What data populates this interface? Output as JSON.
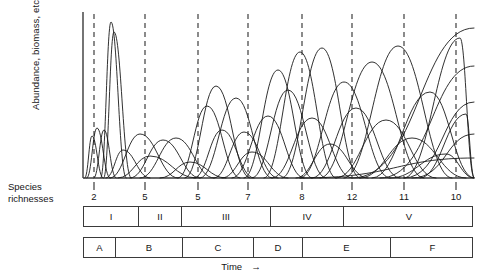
{
  "figure": {
    "y_axis_label": "Abundance, biomass, etc.",
    "x_axis_label": "Time",
    "x_axis_arrow": "→",
    "richness_label_line1": "Species",
    "richness_label_line2": "richnesses"
  },
  "chart_data": {
    "type": "line",
    "title": "",
    "xlabel": "Time",
    "ylabel": "Abundance, biomass, etc.",
    "grid": false,
    "legend": "none",
    "axis_color": "#3a3a3a",
    "curve_color": "#1a1a1a",
    "marker_line_color": "#4d4d4d",
    "marker_line_style": "dashed",
    "xlim": [
      0,
      390
    ],
    "ylim": [
      0,
      166
    ],
    "species_richness_ticks": [
      {
        "label": "2",
        "x": 94
      },
      {
        "label": "5",
        "x": 145
      },
      {
        "label": "5",
        "x": 198
      },
      {
        "label": "7",
        "x": 248
      },
      {
        "label": "8",
        "x": 302
      },
      {
        "label": "12",
        "x": 352
      },
      {
        "label": "11",
        "x": 404
      },
      {
        "label": "10",
        "x": 456
      }
    ],
    "dashed_marker_x": [
      94,
      145,
      198,
      248,
      302,
      352,
      404,
      456
    ],
    "stage_bands_roman": [
      {
        "label": "I",
        "start": 83,
        "end": 138
      },
      {
        "label": "II",
        "start": 138,
        "end": 181
      },
      {
        "label": "III",
        "start": 181,
        "end": 270
      },
      {
        "label": "IV",
        "start": 270,
        "end": 343
      },
      {
        "label": "V",
        "start": 343,
        "end": 473
      }
    ],
    "stage_bands_letter": [
      {
        "label": "A",
        "start": 83,
        "end": 115
      },
      {
        "label": "B",
        "start": 115,
        "end": 182
      },
      {
        "label": "C",
        "start": 182,
        "end": 253
      },
      {
        "label": "D",
        "start": 253,
        "end": 302
      },
      {
        "label": "E",
        "start": 302,
        "end": 390
      },
      {
        "label": "F",
        "start": 390,
        "end": 473
      }
    ],
    "series": [
      {
        "name": "sp-01",
        "peak_x": 92,
        "peak_y": 42,
        "left_x": 85,
        "right_x": 103
      },
      {
        "name": "sp-02",
        "peak_x": 97,
        "peak_y": 50,
        "left_x": 87,
        "right_x": 110
      },
      {
        "name": "sp-03",
        "peak_x": 104,
        "peak_y": 48,
        "left_x": 94,
        "right_x": 116
      },
      {
        "name": "sp-04",
        "peak_x": 111,
        "peak_y": 156,
        "left_x": 101,
        "right_x": 126
      },
      {
        "name": "sp-05",
        "peak_x": 114,
        "peak_y": 146,
        "left_x": 104,
        "right_x": 131
      },
      {
        "name": "sp-06",
        "peak_x": 123,
        "peak_y": 28,
        "left_x": 106,
        "right_x": 150
      },
      {
        "name": "sp-07",
        "peak_x": 140,
        "peak_y": 44,
        "left_x": 110,
        "right_x": 178
      },
      {
        "name": "sp-08",
        "peak_x": 150,
        "peak_y": 22,
        "left_x": 118,
        "right_x": 196
      },
      {
        "name": "sp-09",
        "peak_x": 163,
        "peak_y": 38,
        "left_x": 130,
        "right_x": 200
      },
      {
        "name": "sp-10",
        "peak_x": 176,
        "peak_y": 40,
        "left_x": 140,
        "right_x": 214
      },
      {
        "name": "sp-11",
        "peak_x": 190,
        "peak_y": 16,
        "left_x": 160,
        "right_x": 226
      },
      {
        "name": "sp-12",
        "peak_x": 207,
        "peak_y": 72,
        "left_x": 178,
        "right_x": 240
      },
      {
        "name": "sp-13",
        "peak_x": 216,
        "peak_y": 92,
        "left_x": 185,
        "right_x": 250
      },
      {
        "name": "sp-14",
        "peak_x": 222,
        "peak_y": 48,
        "left_x": 194,
        "right_x": 254
      },
      {
        "name": "sp-15",
        "peak_x": 236,
        "peak_y": 80,
        "left_x": 200,
        "right_x": 272
      },
      {
        "name": "sp-16",
        "peak_x": 244,
        "peak_y": 46,
        "left_x": 214,
        "right_x": 278
      },
      {
        "name": "sp-17",
        "peak_x": 252,
        "peak_y": 26,
        "left_x": 222,
        "right_x": 288
      },
      {
        "name": "sp-18",
        "peak_x": 268,
        "peak_y": 62,
        "left_x": 232,
        "right_x": 304
      },
      {
        "name": "sp-19",
        "peak_x": 278,
        "peak_y": 108,
        "left_x": 244,
        "right_x": 312
      },
      {
        "name": "sp-20",
        "peak_x": 288,
        "peak_y": 88,
        "left_x": 252,
        "right_x": 326
      },
      {
        "name": "sp-21",
        "peak_x": 300,
        "peak_y": 126,
        "left_x": 264,
        "right_x": 336
      },
      {
        "name": "sp-22",
        "peak_x": 312,
        "peak_y": 60,
        "left_x": 272,
        "right_x": 352
      },
      {
        "name": "sp-23",
        "peak_x": 322,
        "peak_y": 130,
        "left_x": 282,
        "right_x": 360
      },
      {
        "name": "sp-24",
        "peak_x": 330,
        "peak_y": 34,
        "left_x": 296,
        "right_x": 368
      },
      {
        "name": "sp-25",
        "peak_x": 344,
        "peak_y": 96,
        "left_x": 300,
        "right_x": 390
      },
      {
        "name": "sp-26",
        "peak_x": 356,
        "peak_y": 70,
        "left_x": 312,
        "right_x": 400
      },
      {
        "name": "sp-27",
        "peak_x": 372,
        "peak_y": 116,
        "left_x": 320,
        "right_x": 424
      },
      {
        "name": "sp-28",
        "peak_x": 386,
        "peak_y": 58,
        "left_x": 336,
        "right_x": 436
      },
      {
        "name": "sp-29",
        "peak_x": 398,
        "peak_y": 132,
        "left_x": 344,
        "right_x": 452
      },
      {
        "name": "sp-30",
        "peak_x": 412,
        "peak_y": 40,
        "left_x": 360,
        "right_x": 466
      },
      {
        "name": "sp-31",
        "peak_x": 430,
        "peak_y": 86,
        "left_x": 372,
        "right_x": 474
      },
      {
        "name": "sp-32",
        "peak_x": 446,
        "peak_y": 24,
        "left_x": 390,
        "right_x": 474
      },
      {
        "name": "sp-33",
        "peak_x": 460,
        "peak_y": 140,
        "left_x": 404,
        "right_x": 474
      },
      {
        "name": "sp-34",
        "peak_x": 466,
        "peak_y": 64,
        "left_x": 420,
        "right_x": 474
      }
    ],
    "rising_tails": [
      {
        "name": "tail-01",
        "start_x": 352,
        "end_x": 474,
        "end_y": 150
      },
      {
        "name": "tail-02",
        "start_x": 380,
        "end_x": 474,
        "end_y": 112
      },
      {
        "name": "tail-03",
        "start_x": 404,
        "end_x": 474,
        "end_y": 76
      },
      {
        "name": "tail-04",
        "start_x": 412,
        "end_x": 474,
        "end_y": 44
      },
      {
        "name": "tail-05",
        "start_x": 300,
        "end_x": 474,
        "end_y": 20
      }
    ]
  }
}
